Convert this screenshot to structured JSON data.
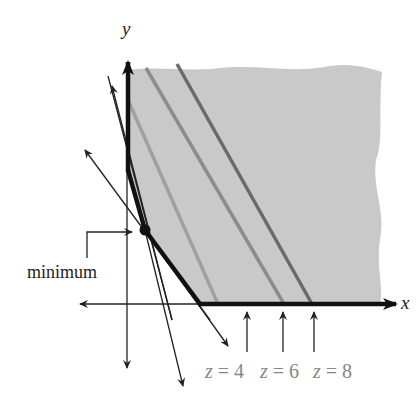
{
  "diagram": {
    "axes": {
      "x_label": "x",
      "y_label": "y"
    },
    "annotation": {
      "label": "minimum"
    },
    "level_lines": [
      {
        "var": "z",
        "eq": "=",
        "value": "4",
        "color": "#9a9a9a"
      },
      {
        "var": "z",
        "eq": "=",
        "value": "6",
        "color": "#8a8a8a"
      },
      {
        "var": "z",
        "eq": "=",
        "value": "8",
        "color": "#6e6e6e"
      }
    ],
    "colors": {
      "region_fill": "#c8c8c8",
      "boundary": "#111111",
      "axis": "#222222"
    }
  }
}
